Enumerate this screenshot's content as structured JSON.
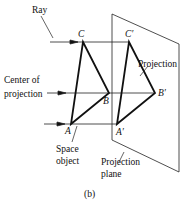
{
  "diagram": {
    "caption": "(b)",
    "labels": {
      "ray": "Ray",
      "center_line1": "Center of",
      "center_line2": "projection",
      "projection": "Projection",
      "space_line1": "Space",
      "space_line2": "object",
      "plane_line1": "Projection",
      "plane_line2": "plane"
    },
    "points": {
      "A": "A",
      "B": "B",
      "C": "C",
      "A_prime": "A′",
      "B_prime": "B′",
      "C_prime": "C′"
    },
    "colors": {
      "stroke": "#111111",
      "background": "#ffffff"
    }
  }
}
